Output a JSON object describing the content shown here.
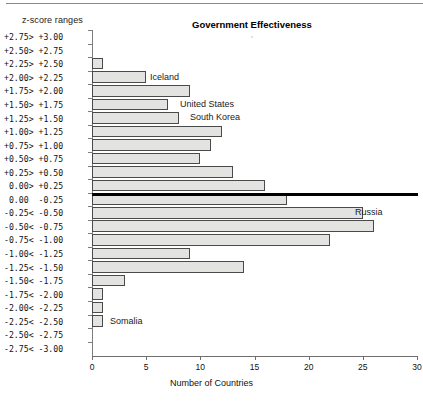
{
  "header": {
    "zscore_header": "z-score ranges",
    "title": "Government Effectiveness"
  },
  "axis": {
    "x_title": "Number of Countries",
    "x_ticks": [
      "0",
      "5",
      "10",
      "15",
      "20",
      "25",
      "30"
    ]
  },
  "annotations": [
    {
      "label": "Iceland",
      "bin": "+2.00> +2.25"
    },
    {
      "label": "United States",
      "bin": "+1.50> +1.75"
    },
    {
      "label": "South Korea",
      "bin": "+1.25> +1.50"
    },
    {
      "label": "Russia",
      "bin": "-0.25< -0.50"
    },
    {
      "label": "Somalia",
      "bin": "-2.25< -2.50"
    }
  ],
  "chart_data": {
    "type": "bar",
    "orientation": "horizontal",
    "title": "Government Effectiveness",
    "xlabel": "Number of Countries",
    "ylabel": "z-score ranges",
    "xlim": [
      0,
      30
    ],
    "grid": false,
    "legend": null,
    "categories": [
      "+2.75> +3.00",
      "+2.50> +2.75",
      "+2.25> +2.50",
      "+2.00> +2.25",
      "+1.75> +2.00",
      "+1.50> +1.75",
      "+1.25> +1.50",
      "+1.00> +1.25",
      "+0.75> +1.00",
      "+0.50> +0.75",
      "+0.25> +0.50",
      " 0.00> +0.25",
      " 0.00  -0.25",
      "-0.25< -0.50",
      "-0.50< -0.75",
      "-0.75< -1.00",
      "-1.00< -1.25",
      "-1.25< -1.50",
      "-1.50< -1.75",
      "-1.75< -2.00",
      "-2.00< -2.25",
      "-2.25< -2.50",
      "-2.50< -2.75",
      "-2.75< -3.00"
    ],
    "values": [
      0,
      0,
      1,
      5,
      9,
      7,
      8,
      12,
      11,
      10,
      13,
      16,
      18,
      25,
      26,
      22,
      9,
      14,
      3,
      1,
      1,
      1,
      0,
      0
    ]
  }
}
